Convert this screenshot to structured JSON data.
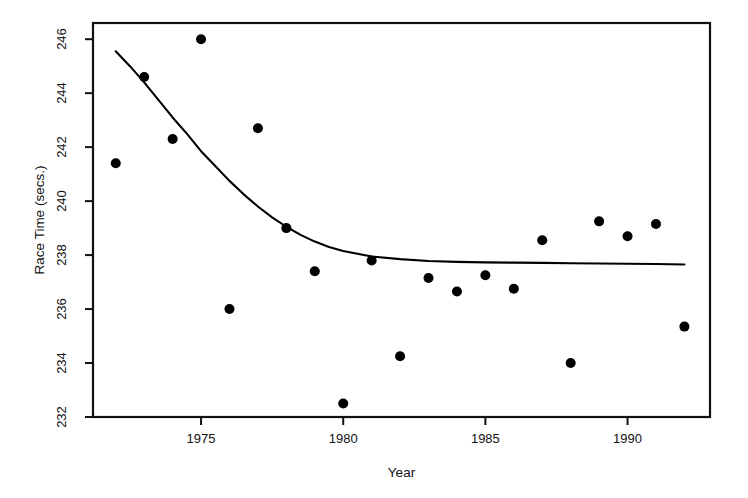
{
  "chart_data": {
    "type": "scatter",
    "title": "",
    "xlabel": "Year",
    "ylabel": "Race Time (secs.)",
    "xlim": [
      1971.2,
      1992.9
    ],
    "ylim": [
      232,
      246.6
    ],
    "grid": false,
    "legend": "none",
    "x_ticks": [
      1975,
      1980,
      1985,
      1990
    ],
    "y_ticks": [
      232,
      234,
      236,
      238,
      240,
      242,
      244,
      246
    ],
    "series": [
      {
        "name": "Race time observations",
        "type": "scatter",
        "marker": "filled-circle",
        "color": "#000000",
        "x": [
          1972,
          1973,
          1974,
          1975,
          1976,
          1977,
          1978,
          1979,
          1980,
          1981,
          1982,
          1983,
          1984,
          1985,
          1986,
          1987,
          1988,
          1989,
          1990,
          1991,
          1992
        ],
        "y": [
          241.4,
          244.6,
          242.3,
          246.0,
          236.0,
          242.7,
          239.0,
          237.4,
          232.5,
          237.8,
          234.25,
          237.15,
          236.65,
          237.25,
          236.75,
          238.55,
          234.0,
          239.25,
          238.7,
          239.15,
          235.35
        ]
      },
      {
        "name": "Fitted trend curve",
        "type": "line",
        "color": "#000000",
        "x": [
          1972.0,
          1972.5,
          1973.0,
          1973.5,
          1974.0,
          1974.5,
          1975.0,
          1975.5,
          1976.0,
          1976.5,
          1977.0,
          1977.5,
          1978.0,
          1978.5,
          1979.0,
          1979.5,
          1980.0,
          1981.0,
          1982.0,
          1983.0,
          1984.0,
          1985.0,
          1986.0,
          1987.0,
          1988.0,
          1989.0,
          1990.0,
          1991.0,
          1992.0
        ],
        "y": [
          245.55,
          245.0,
          244.4,
          243.75,
          243.1,
          242.5,
          241.85,
          241.3,
          240.75,
          240.25,
          239.8,
          239.4,
          239.05,
          238.75,
          238.5,
          238.3,
          238.15,
          237.95,
          237.85,
          237.78,
          237.75,
          237.73,
          237.72,
          237.71,
          237.7,
          237.69,
          237.68,
          237.67,
          237.65
        ]
      }
    ]
  },
  "style": {
    "axis_color": "#111111",
    "point_color": "#000000",
    "line_color": "#000000",
    "background": "#ffffff"
  }
}
